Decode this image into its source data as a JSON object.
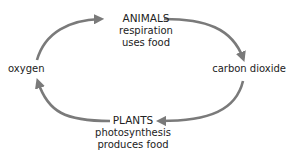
{
  "diagram": {
    "type": "cycle",
    "colors": {
      "arrow": "#7a7a7a",
      "text": "#222222",
      "background": "#ffffff"
    },
    "nodes": {
      "animals": {
        "title": "ANIMALS",
        "lines": [
          "respiration",
          "uses food"
        ]
      },
      "carbon_dioxide": {
        "label": "carbon dioxide"
      },
      "plants": {
        "title": "PLANTS",
        "lines": [
          "photosynthesis",
          "produces food"
        ]
      },
      "oxygen": {
        "label": "oxygen"
      }
    },
    "edges": [
      {
        "from": "oxygen",
        "to": "ANIMALS"
      },
      {
        "from": "ANIMALS",
        "to": "carbon dioxide"
      },
      {
        "from": "carbon dioxide",
        "to": "PLANTS"
      },
      {
        "from": "PLANTS",
        "to": "oxygen"
      }
    ]
  }
}
